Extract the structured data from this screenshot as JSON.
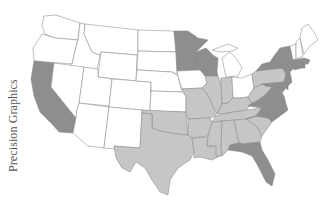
{
  "map": {
    "type": "choropleth",
    "region": "United States (contiguous)",
    "credit": "Precision Graphics",
    "legend_levels": [
      {
        "name": "none",
        "color": "#ffffff"
      },
      {
        "name": "light",
        "color": "#c6c6c6"
      },
      {
        "name": "dark",
        "color": "#8e8e8e"
      }
    ],
    "states": {
      "WA": "none",
      "OR": "none",
      "CA": "dark",
      "ID": "none",
      "NV": "none",
      "MT": "none",
      "WY": "none",
      "UT": "none",
      "AZ": "none",
      "CO": "none",
      "NM": "none",
      "ND": "none",
      "SD": "none",
      "NE": "none",
      "KS": "none",
      "OK": "light",
      "TX": "light",
      "MN": "dark",
      "IA": "none",
      "MO": "light",
      "AR": "light",
      "LA": "light",
      "WI": "dark",
      "IL": "light",
      "MI": "none",
      "IN": "light",
      "OH": "none",
      "KY": "light",
      "TN": "light",
      "MS": "light",
      "AL": "light",
      "GA": "light",
      "FL": "dark",
      "SC": "light",
      "NC": "dark",
      "VA": "dark",
      "WV": "light",
      "PA": "light",
      "NY": "dark",
      "VT": "none",
      "NH": "none",
      "ME": "none",
      "MA": "dark",
      "RI": "dark",
      "CT": "dark",
      "NJ": "dark",
      "DE": "dark",
      "MD": "dark"
    }
  }
}
